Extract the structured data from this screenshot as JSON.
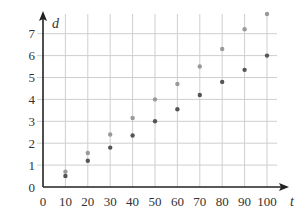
{
  "chart_data": {
    "type": "scatter",
    "title": "",
    "xlabel": "t",
    "ylabel": "d",
    "xlim": [
      0,
      100
    ],
    "ylim": [
      0,
      7
    ],
    "x_ticks": [
      "0",
      "10",
      "20",
      "30",
      "40",
      "50",
      "60",
      "70",
      "80",
      "90",
      "100"
    ],
    "y_ticks": [
      "0",
      "1",
      "2",
      "3",
      "4",
      "5",
      "6",
      "7"
    ],
    "grid": true,
    "legend": null,
    "x": [
      10,
      20,
      30,
      40,
      50,
      60,
      70,
      80,
      90,
      100
    ],
    "series": [
      {
        "name": "upper (light grey)",
        "color": "#9a9a9a",
        "values": [
          0.7,
          1.55,
          2.4,
          3.15,
          4.0,
          4.7,
          5.5,
          6.3,
          7.2,
          7.9
        ]
      },
      {
        "name": "lower (dark grey)",
        "color": "#555555",
        "values": [
          0.5,
          1.2,
          1.8,
          2.35,
          3.0,
          3.55,
          4.2,
          4.8,
          5.35,
          6.0
        ]
      }
    ]
  },
  "colors": {
    "grid": "#cfcfcf",
    "axis": "#222222",
    "text": "#333333"
  }
}
